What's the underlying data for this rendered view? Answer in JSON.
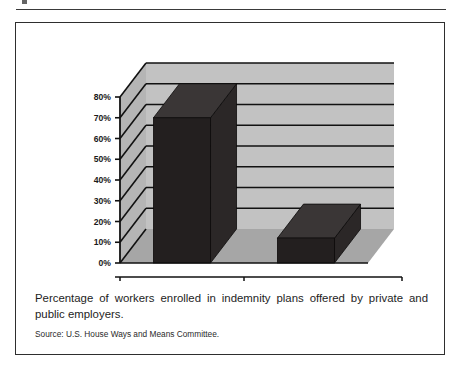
{
  "figure": {
    "caption": "Percentage of workers enrolled in indemnity plans offered by private and public employers.",
    "source": "Source:  U.S. House Ways and Means Committee."
  },
  "colors": {
    "back_wall": "#c2c2c2",
    "side_wall": "#b5b5b5",
    "floor": "#a6a6a6",
    "floor_front": "#9a9a9a",
    "bar_front": "#231f1f",
    "bar_top": "#3a3636",
    "bar_side": "#2b2727",
    "gridline": "#111111",
    "axis": "#111111",
    "text": "#1a1a1a",
    "frame": "#2e2e2e"
  },
  "chart_data": {
    "type": "bar",
    "title": "",
    "subtitle": "",
    "xlabel": "",
    "ylabel": "",
    "categories": [
      "1988",
      "1998"
    ],
    "values": [
      70,
      12
    ],
    "value_labels": [
      "70%",
      "12%"
    ],
    "ylim": [
      0,
      80
    ],
    "ytick_values": [
      0,
      10,
      20,
      30,
      40,
      50,
      60,
      70,
      80
    ],
    "ytick_labels": [
      "0%",
      "10%",
      "20%",
      "30%",
      "40%",
      "50%",
      "60%",
      "70%",
      "80%"
    ],
    "grid": true,
    "grid_axis": "y",
    "legend": false,
    "legend_position": "none",
    "three_d": true,
    "series": [
      {
        "name": "Workers enrolled in indemnity plans",
        "values": [
          70,
          12
        ]
      }
    ],
    "annotations": []
  }
}
